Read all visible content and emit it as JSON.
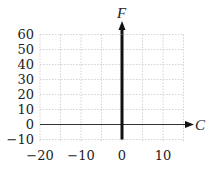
{
  "chart_data": {
    "type": "line",
    "title": "",
    "xlabel": "C",
    "ylabel": "F",
    "xlim": [
      -20,
      15
    ],
    "ylim": [
      -10,
      60
    ],
    "grid": true,
    "x_ticks": [
      -20,
      -10,
      0,
      10
    ],
    "x_tick_labels": [
      "−20",
      "−10",
      "0",
      "10"
    ],
    "y_ticks": [
      -10,
      0,
      10,
      20,
      30,
      40,
      50,
      60
    ],
    "y_tick_labels": [
      "−10",
      "0",
      "10",
      "20",
      "30",
      "40",
      "50",
      "60"
    ],
    "x_grid_step": 5,
    "y_grid_step": 10,
    "series": [
      {
        "name": "vertical line C = 0",
        "x": [
          0,
          0
        ],
        "y": [
          -10,
          60
        ],
        "style": "thick solid black"
      }
    ],
    "legend": null
  },
  "axes": {
    "x_label": "C",
    "y_label": "F"
  }
}
